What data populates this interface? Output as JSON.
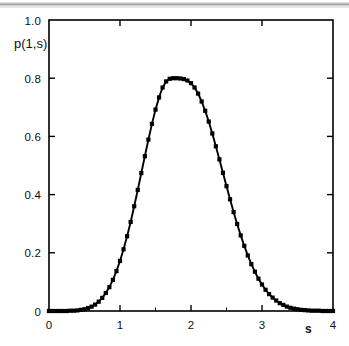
{
  "figure": {
    "background_color": "#ffffff",
    "ink_color": "#000000",
    "scan_artifact": "horizontal-gray-scan-line-top"
  },
  "axes": {
    "frame": {
      "left_px": 49,
      "right_px": 333,
      "top_px": 20,
      "bottom_px": 311
    },
    "x_label": "s",
    "y_label": "p(1,s)",
    "x_ticks": [
      "0",
      "1",
      "2",
      "3",
      "4"
    ],
    "y_ticks": [
      "0",
      "0.2",
      "0.4",
      "0.6",
      "0.8",
      "1.0"
    ],
    "ticks_on_all_sides": true
  },
  "chart_data": {
    "type": "line",
    "title": "",
    "subtitle": "",
    "xlabel": "s",
    "ylabel": "p(1,s)",
    "xlim": [
      0,
      4
    ],
    "ylim": [
      0,
      1.0
    ],
    "xticks": [
      0,
      1,
      2,
      3,
      4
    ],
    "yticks": [
      0,
      0.2,
      0.4,
      0.6,
      0.8,
      1.0
    ],
    "grid": false,
    "legend": null,
    "legend_position": "none",
    "annotations": [],
    "peak": {
      "x": 1.92,
      "y": 0.8
    },
    "series": [
      {
        "name": "p(1,s) curve",
        "style": "solid-line",
        "marker": "none",
        "x": [
          0.0,
          0.05,
          0.1,
          0.15,
          0.2,
          0.25,
          0.3,
          0.35,
          0.4,
          0.45,
          0.5,
          0.55,
          0.6,
          0.65,
          0.7,
          0.75,
          0.8,
          0.85,
          0.9,
          0.95,
          1.0,
          1.05,
          1.1,
          1.15,
          1.2,
          1.25,
          1.3,
          1.35,
          1.4,
          1.45,
          1.5,
          1.55,
          1.6,
          1.65,
          1.7,
          1.75,
          1.8,
          1.85,
          1.9,
          1.95,
          2.0,
          2.05,
          2.1,
          2.15,
          2.2,
          2.25,
          2.3,
          2.35,
          2.4,
          2.45,
          2.5,
          2.55,
          2.6,
          2.65,
          2.7,
          2.75,
          2.8,
          2.85,
          2.9,
          2.95,
          3.0,
          3.05,
          3.1,
          3.15,
          3.2,
          3.25,
          3.3,
          3.35,
          3.4,
          3.45,
          3.5,
          3.55,
          3.6,
          3.65,
          3.7,
          3.75,
          3.8,
          3.85,
          3.9,
          3.95,
          4.0
        ],
        "y": [
          0.0,
          0.0,
          0.0,
          0.0,
          0.0,
          0.0,
          0.001,
          0.001,
          0.002,
          0.004,
          0.006,
          0.01,
          0.015,
          0.022,
          0.032,
          0.045,
          0.062,
          0.082,
          0.107,
          0.137,
          0.172,
          0.212,
          0.257,
          0.306,
          0.36,
          0.416,
          0.474,
          0.532,
          0.589,
          0.643,
          0.692,
          0.734,
          0.768,
          0.789,
          0.798,
          0.8,
          0.8,
          0.799,
          0.797,
          0.792,
          0.783,
          0.768,
          0.747,
          0.72,
          0.688,
          0.651,
          0.61,
          0.566,
          0.521,
          0.475,
          0.429,
          0.384,
          0.34,
          0.299,
          0.26,
          0.224,
          0.191,
          0.161,
          0.135,
          0.111,
          0.091,
          0.073,
          0.058,
          0.046,
          0.036,
          0.027,
          0.021,
          0.015,
          0.011,
          0.008,
          0.006,
          0.004,
          0.003,
          0.002,
          0.001,
          0.001,
          0.001,
          0.0,
          0.0,
          0.0,
          0.0
        ]
      },
      {
        "name": "p(1,s) data points",
        "style": "markers",
        "marker": "filled-square",
        "x": [
          0.0,
          0.05,
          0.1,
          0.15,
          0.2,
          0.25,
          0.3,
          0.35,
          0.4,
          0.45,
          0.5,
          0.55,
          0.6,
          0.65,
          0.7,
          0.75,
          0.8,
          0.85,
          0.9,
          0.95,
          1.0,
          1.05,
          1.1,
          1.15,
          1.2,
          1.25,
          1.3,
          1.35,
          1.4,
          1.45,
          1.5,
          1.55,
          1.6,
          1.65,
          1.7,
          1.75,
          1.8,
          1.85,
          1.9,
          1.95,
          2.0,
          2.05,
          2.1,
          2.15,
          2.2,
          2.25,
          2.3,
          2.35,
          2.4,
          2.45,
          2.5,
          2.55,
          2.6,
          2.65,
          2.7,
          2.75,
          2.8,
          2.85,
          2.9,
          2.95,
          3.0,
          3.05,
          3.1,
          3.15,
          3.2,
          3.25,
          3.3,
          3.35,
          3.4,
          3.45,
          3.5,
          3.55,
          3.6,
          3.65,
          3.7,
          3.75,
          3.8,
          3.85,
          3.9,
          3.95,
          4.0
        ],
        "y": [
          0.0,
          0.0,
          0.0,
          0.0,
          0.0,
          0.0,
          0.001,
          0.001,
          0.002,
          0.004,
          0.006,
          0.01,
          0.015,
          0.022,
          0.032,
          0.045,
          0.062,
          0.082,
          0.107,
          0.137,
          0.172,
          0.212,
          0.257,
          0.306,
          0.36,
          0.416,
          0.474,
          0.532,
          0.589,
          0.643,
          0.692,
          0.734,
          0.768,
          0.789,
          0.798,
          0.8,
          0.8,
          0.799,
          0.797,
          0.792,
          0.783,
          0.768,
          0.747,
          0.72,
          0.688,
          0.651,
          0.61,
          0.566,
          0.521,
          0.475,
          0.429,
          0.384,
          0.34,
          0.299,
          0.26,
          0.224,
          0.191,
          0.161,
          0.135,
          0.111,
          0.091,
          0.073,
          0.058,
          0.046,
          0.036,
          0.027,
          0.021,
          0.015,
          0.011,
          0.008,
          0.006,
          0.004,
          0.003,
          0.002,
          0.001,
          0.001,
          0.001,
          0.0,
          0.0,
          0.0,
          0.0
        ]
      }
    ]
  }
}
